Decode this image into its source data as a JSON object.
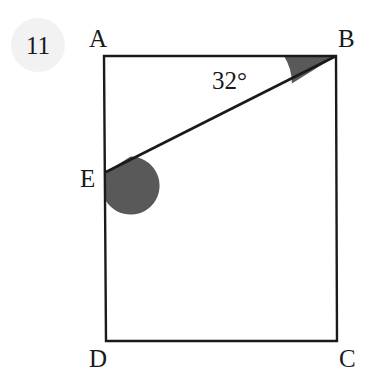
{
  "figure": {
    "problem_number": "11",
    "background_color": "#ffffff",
    "stroke_color": "#1a1a1a",
    "shade_color": "#595959",
    "watermark_color": "#f2f2f2",
    "vertices": [
      {
        "name": "A",
        "label": "A",
        "x": 104,
        "y": 56,
        "label_x": 89,
        "label_y": 47
      },
      {
        "name": "B",
        "label": "B",
        "x": 336,
        "y": 56,
        "label_x": 338,
        "label_y": 47
      },
      {
        "name": "C",
        "label": "C",
        "x": 337,
        "y": 341,
        "label_x": 339,
        "label_y": 367
      },
      {
        "name": "D",
        "label": "D",
        "x": 106,
        "y": 341,
        "label_x": 89,
        "label_y": 367
      },
      {
        "name": "E",
        "label": "E",
        "x": 106,
        "y": 172,
        "label_x": 80,
        "label_y": 187
      }
    ],
    "segments": [
      {
        "name": "side-AB",
        "from": "A",
        "to": "B"
      },
      {
        "name": "side-BC",
        "from": "B",
        "to": "C"
      },
      {
        "name": "side-CD",
        "from": "C",
        "to": "D"
      },
      {
        "name": "side-DA",
        "from": "D",
        "to": "A"
      },
      {
        "name": "transversal-EB",
        "from": "E",
        "to": "B"
      }
    ],
    "angles": [
      {
        "name": "angle-at-B",
        "vertex": "B",
        "label": "32°",
        "value": 32,
        "shaded": true,
        "radius": 52,
        "label_x": 212,
        "label_y": 89
      },
      {
        "name": "angle-at-E",
        "vertex": "E",
        "label": "",
        "shaded": true,
        "radius": 29
      }
    ]
  }
}
